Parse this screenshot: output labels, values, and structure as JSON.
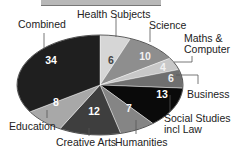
{
  "chart_data": {
    "type": "pie",
    "title": "",
    "start_angle_deg": 0,
    "direction": "clockwise",
    "slices": [
      {
        "label": "Health Subjects",
        "value": 6,
        "color": "#d6d6d6"
      },
      {
        "label": "Science",
        "value": 10,
        "color": "#8e8e8e"
      },
      {
        "label": "Maths & Computer",
        "value": 4,
        "color": "#c8c8c8"
      },
      {
        "label": "Business",
        "value": 6,
        "color": "#6f6f6f"
      },
      {
        "label": "Social Studies incl Law",
        "value": 13,
        "color": "#0a0a0a"
      },
      {
        "label": "Humanities",
        "value": 7,
        "color": "#858585"
      },
      {
        "label": "Creative Arts",
        "value": 12,
        "color": "#3e3e3e"
      },
      {
        "label": "Education",
        "value": 8,
        "color": "#a8a8a8"
      },
      {
        "label": "Combined",
        "value": 34,
        "color": "#1f1f1f"
      }
    ],
    "categories": [
      "Health Subjects",
      "Science",
      "Maths & Computer",
      "Business",
      "Social Studies incl Law",
      "Humanities",
      "Creative Arts",
      "Education",
      "Combined"
    ],
    "values": [
      6,
      10,
      4,
      6,
      13,
      7,
      12,
      8,
      34
    ],
    "legend": "callout labels"
  },
  "labels": {
    "health": "Health Subjects",
    "science": "Science",
    "maths_1": "Maths &",
    "maths_2": "Computer",
    "business": "Business",
    "social_1": "Social Studies",
    "social_2": "incl Law",
    "humanities": "Humanities",
    "creative": "Creative Arts",
    "education": "Education",
    "combined": "Combined"
  },
  "values": {
    "health": "6",
    "science": "10",
    "maths": "4",
    "business": "6",
    "social": "13",
    "humanities": "7",
    "creative": "12",
    "education": "8",
    "combined": "34"
  }
}
